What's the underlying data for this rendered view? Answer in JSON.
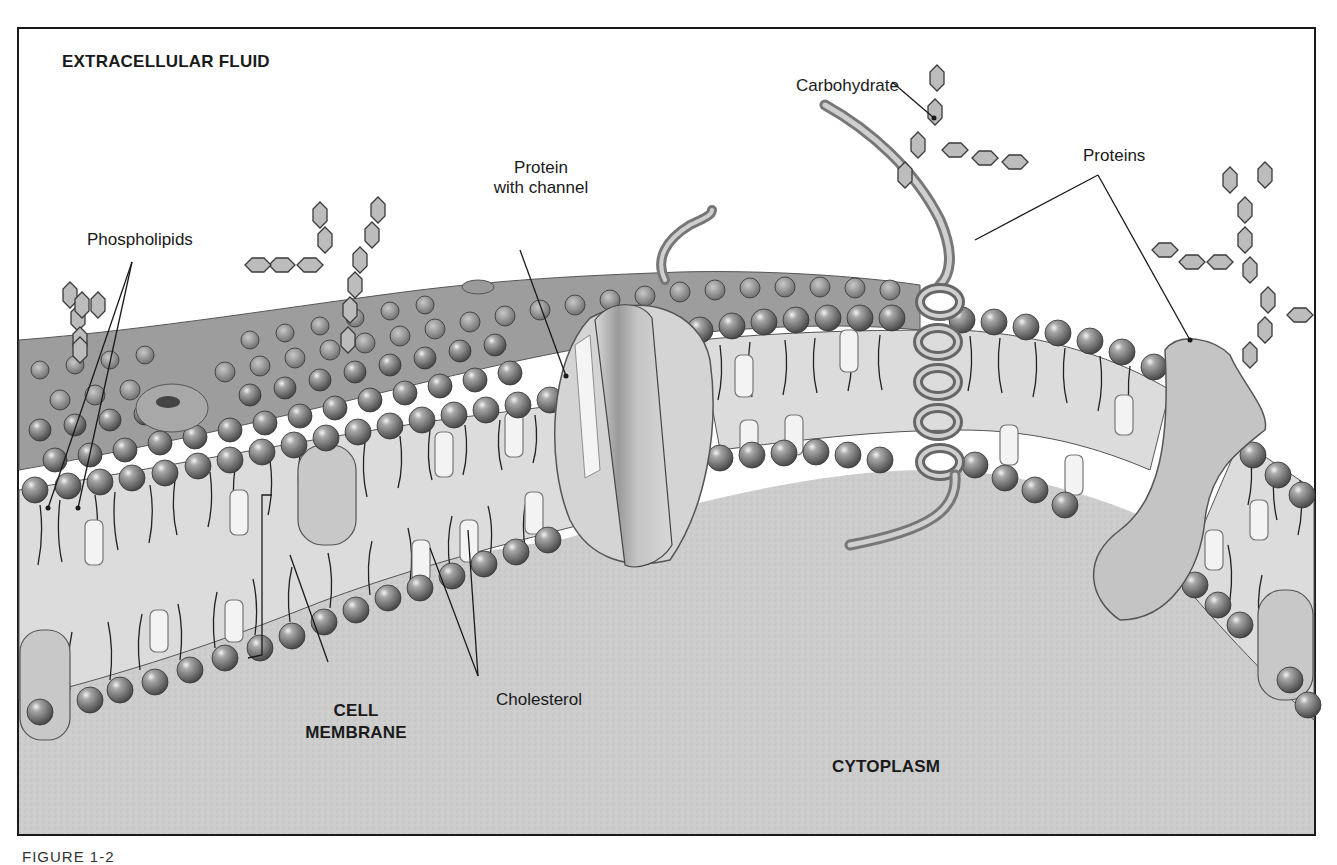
{
  "figure": {
    "caption": "FIGURE 1-2"
  },
  "regions": {
    "extracellular": "EXTRACELLULAR FLUID",
    "cytoplasm": "CYTOPLASM",
    "membrane_line1": "CELL",
    "membrane_line2": "MEMBRANE"
  },
  "labels": {
    "phospholipids": "Phospholipids",
    "protein_channel_line1": "Protein",
    "protein_channel_line2": "with channel",
    "carbohydrate": "Carbohydrate",
    "proteins": "Proteins",
    "cholesterol": "Cholesterol"
  },
  "colors": {
    "frame": "#1a1a1a",
    "background": "#ffffff",
    "cytoplasm": "#cfcfcf",
    "membrane_interior": "#d9d9d9",
    "phospholipid_head": "#8a8a8a",
    "cholesterol": "#f2f2f2",
    "protein": "#bdbdbd",
    "carbohydrate": "#b8b8b8"
  }
}
